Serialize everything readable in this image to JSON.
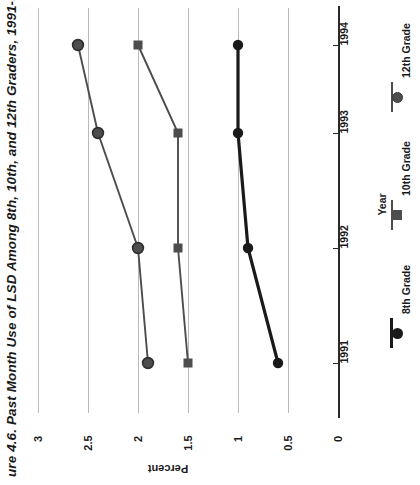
{
  "figure": {
    "title": "ure 4.6. Past Month Use of LSD Among 8th, 10th, and 12th Graders, 1991-94."
  },
  "axes": {
    "percent_label": "Percent",
    "year_label": "Year",
    "percent_ticks": [
      "3",
      "2.5",
      "2",
      "1.5",
      "1",
      "0.5",
      "0"
    ],
    "year_ticks": [
      "1991",
      "1992",
      "1993",
      "1994"
    ]
  },
  "legend": {
    "items": [
      {
        "label": "8th Grade",
        "marker": "circle",
        "color": "#1a1a1a"
      },
      {
        "label": "10th Grade",
        "marker": "square",
        "color": "#4d4d4d"
      },
      {
        "label": "12th Grade",
        "marker": "circle",
        "color": "#4d4d4d"
      }
    ]
  },
  "chart_data": {
    "type": "line",
    "xlabel": "Year",
    "ylabel": "Percent",
    "categories": [
      "1991",
      "1992",
      "1993",
      "1994"
    ],
    "ylim": [
      0,
      3
    ],
    "yticks": [
      0,
      0.5,
      1,
      1.5,
      2,
      2.5,
      3
    ],
    "grid": true,
    "orientation": "rotated-90-ccw",
    "legend_position": "right",
    "series": [
      {
        "name": "8th Grade",
        "marker": "circle",
        "color": "#1a1a1a",
        "values": [
          0.6,
          0.9,
          1.0,
          1.0
        ]
      },
      {
        "name": "10th Grade",
        "marker": "square",
        "color": "#4d4d4d",
        "values": [
          1.5,
          1.6,
          1.6,
          2.0
        ]
      },
      {
        "name": "12th Grade",
        "marker": "circle",
        "color": "#4d4d4d",
        "values": [
          1.9,
          2.0,
          2.4,
          2.6
        ]
      }
    ]
  }
}
